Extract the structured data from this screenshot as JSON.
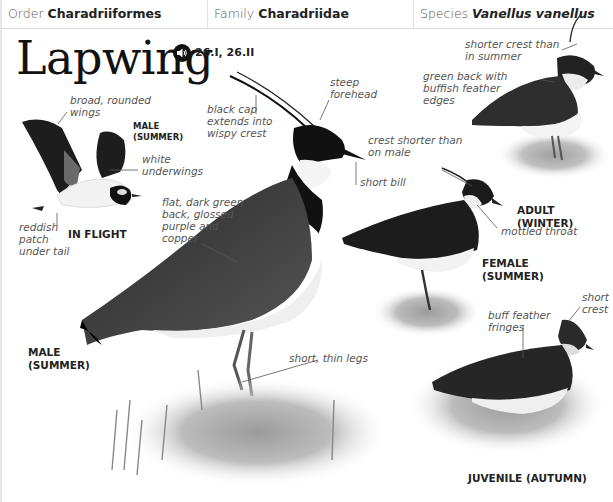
{
  "header": {
    "order_label": "Order",
    "order_value": "Charadriiformes",
    "family_label": "Family",
    "family_value": "Charadriidae",
    "species_label": "Species",
    "species_value": "Vanellus vanellus"
  },
  "title": "Lapwing",
  "audio": {
    "icon": "speaker-icon",
    "refs": "26.I, 26.II"
  },
  "figures": {
    "in_flight": {
      "caption": "IN FLIGHT",
      "sub_caption": "MALE\n(SUMMER)",
      "annotations": {
        "wings": "broad, rounded\nwings",
        "underwings": "white\nunderwings",
        "tail": "reddish\npatch\nunder tail"
      }
    },
    "male_summer": {
      "caption": "MALE\n(SUMMER)",
      "annotations": {
        "cap": "black cap\nextends into\nwispy crest",
        "forehead": "steep\nforehead",
        "bill": "short bill",
        "back": "flat, dark green\nback, glossed\npurple and\ncopper",
        "legs": "short, thin legs"
      }
    },
    "adult_winter": {
      "caption": "ADULT (WINTER)",
      "annotations": {
        "crest": "shorter crest than\nin summer",
        "back": "green back with\nbuffish feather\nedges"
      }
    },
    "female_summer": {
      "caption": "FEMALE\n(SUMMER)",
      "annotations": {
        "crest": "crest shorter than\non male",
        "throat": "mottled throat"
      }
    },
    "juvenile_autumn": {
      "caption": "JUVENILE (AUTUMN)",
      "annotations": {
        "fringes": "buff feather\nfringes",
        "crest": "short\ncrest"
      }
    }
  }
}
